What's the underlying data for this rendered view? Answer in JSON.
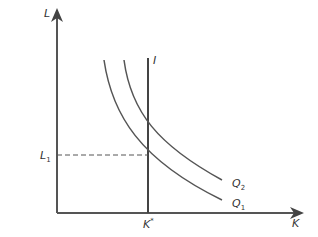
{
  "diagram": {
    "axes": {
      "y_label": "L",
      "x_label": "K"
    },
    "curves": [
      {
        "name": "Q",
        "subscript": "2",
        "type": "isoquant"
      },
      {
        "name": "Q",
        "subscript": "1",
        "type": "isoquant"
      }
    ],
    "vertical_line": {
      "label": "I"
    },
    "markers": {
      "l1": {
        "main": "L",
        "sub": "1"
      },
      "kstar": {
        "main": "K",
        "sup": "*"
      }
    },
    "colors": {
      "line": "#444444",
      "background": "#ffffff"
    }
  }
}
